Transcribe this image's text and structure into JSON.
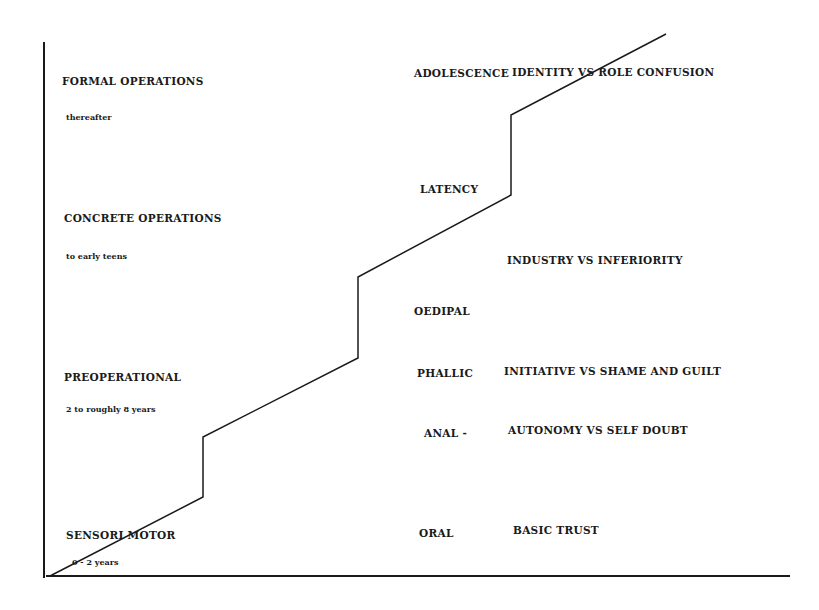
{
  "diagram": {
    "colors": {
      "background": "#ffffff",
      "line": "#1a1a1a",
      "text": "#1a1a1a"
    },
    "axes": {
      "vertical": {
        "x": 44,
        "y1": 42,
        "y2": 578
      },
      "horizontal": {
        "y": 576,
        "x1": 46,
        "x2": 790
      }
    },
    "step_line_points": [
      [
        50,
        576
      ],
      [
        203,
        497
      ],
      [
        203,
        437
      ],
      [
        358,
        358
      ],
      [
        358,
        277
      ],
      [
        511,
        195
      ],
      [
        511,
        115
      ],
      [
        666,
        34
      ]
    ],
    "piaget_stages": [
      {
        "stage": "FORMAL OPERATIONS",
        "age": "thereafter"
      },
      {
        "stage": "CONCRETE  OPERATIONS",
        "age": "to early teens"
      },
      {
        "stage": "PREOPERATIONAL",
        "age": "2 to roughly 8 years"
      },
      {
        "stage": "SENSORI MOTOR",
        "age": "0 - 2 years"
      }
    ],
    "freud_stages": [
      {
        "label": "ADOLESCENCE"
      },
      {
        "label": "LATENCY"
      },
      {
        "label": "OEDIPAL"
      },
      {
        "label": "PHALLIC"
      },
      {
        "label": "ANAL -"
      },
      {
        "label": "ORAL"
      }
    ],
    "erikson_stages": [
      {
        "label": "IDENTITY VS ROLE CONFUSION"
      },
      {
        "label": "INDUSTRY VS INFERIORITY"
      },
      {
        "label": "INITIATIVE VS SHAME AND GUILT"
      },
      {
        "label": "AUTONOMY VS SELF DOUBT"
      },
      {
        "label": "BASIC TRUST"
      }
    ]
  }
}
